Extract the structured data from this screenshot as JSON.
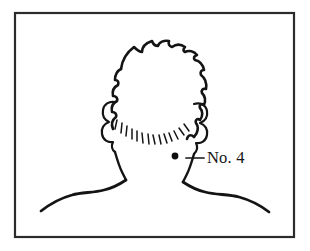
{
  "figure": {
    "kind": "line-drawing",
    "background_color": "#ffffff",
    "ink_color": "#141414",
    "frame": {
      "name": "border",
      "color": "#2b2b2b",
      "x": 15,
      "y": 13,
      "width": 279,
      "height": 224
    }
  },
  "annotation": {
    "label": "No. 4",
    "marker": {
      "shape": "filled-dot",
      "color": "#0d0d0d",
      "x": 175,
      "y": 156,
      "radius": 3.4
    },
    "leader": {
      "x1": 186,
      "y1": 158,
      "x2": 204,
      "y2": 158
    },
    "label_position": {
      "x": 207,
      "y": 163
    }
  }
}
